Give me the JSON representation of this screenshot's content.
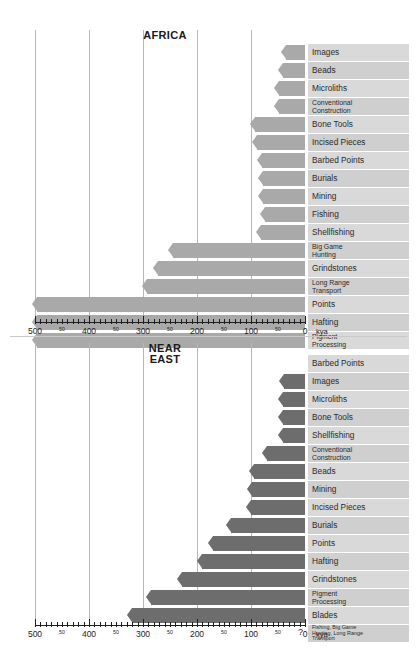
{
  "figure": {
    "unit_label": "kya",
    "colors": {
      "bar_light": "#a9a9a9",
      "bar_dark": "#6d6d6d",
      "label_cell": "#d9d9d9",
      "label_cell_alt": "#cfcfcf",
      "gridline": "#b6b6b6",
      "axis": "#1d1d1d"
    }
  },
  "chart_data": [
    {
      "type": "bar",
      "title": "AFRICA",
      "xlabel": "kya",
      "ylabel": "",
      "xlim": [
        500,
        0
      ],
      "x_reversed": true,
      "grid": true,
      "gridlines": [
        500,
        400,
        300,
        200,
        100
      ],
      "major_ticks": [
        500,
        400,
        300,
        200,
        100,
        0
      ],
      "minor_tick_labels": [
        "50",
        "50",
        "50",
        "50",
        "50"
      ],
      "minor_tick_values": [
        450,
        350,
        250,
        150,
        50
      ],
      "tick_labels": [
        "500",
        "50",
        "400",
        "50",
        "300",
        "50",
        "200",
        "50",
        "100",
        "50",
        "0"
      ],
      "legend": "none",
      "categories": [
        "Images",
        "Beads",
        "Microliths",
        "Conventional\nConstruction",
        "Bone Tools",
        "Incised Pieces",
        "Barbed Points",
        "Burials",
        "Mining",
        "Fishing",
        "Shellfishing",
        "Big Game\nHunting",
        "Grindstones",
        "Long Range\nTransport",
        "Points",
        "Hafting",
        "Pigment\nProcessing"
      ],
      "values": [
        35,
        40,
        48,
        48,
        92,
        88,
        80,
        78,
        78,
        75,
        82,
        245,
        272,
        292,
        497,
        497,
        497
      ]
    },
    {
      "type": "bar",
      "title": "NEAR\nEAST",
      "xlabel": "kya",
      "ylabel": "",
      "xlim": [
        500,
        0
      ],
      "x_reversed": true,
      "grid": true,
      "gridlines": [
        500,
        400,
        300,
        200,
        100
      ],
      "major_ticks": [
        500,
        400,
        300,
        200,
        100,
        0
      ],
      "minor_tick_labels": [
        "50",
        "50",
        "50",
        "50",
        "50"
      ],
      "minor_tick_values": [
        450,
        350,
        250,
        150,
        50
      ],
      "tick_labels": [
        "500",
        "50",
        "400",
        "50",
        "300",
        "50",
        "200",
        "50",
        "100",
        "50",
        "0"
      ],
      "legend": "none",
      "categories": [
        "Barbed Points",
        "Images",
        "Microliths",
        "Bone Tools",
        "Shellfishing",
        "Conventional\nConstruction",
        "Beads",
        "Mining",
        "Incised Pieces",
        "Burials",
        "Points",
        "Hafting",
        "Grindstones",
        "Pigment\nProcessing",
        "Blades",
        "Fishing, Big Game\nHunting, Long Range\nTransport"
      ],
      "values": [
        0,
        38,
        40,
        40,
        40,
        70,
        95,
        98,
        100,
        137,
        170,
        190,
        228,
        285,
        320,
        0
      ],
      "annotations": [
        {
          "row": 15,
          "text": "?"
        }
      ]
    }
  ],
  "panels": [
    {
      "name": "africa-panel",
      "title": "AFRICA"
    },
    {
      "name": "near-east-panel",
      "title_line1": "NEAR",
      "title_line2": "EAST"
    }
  ]
}
